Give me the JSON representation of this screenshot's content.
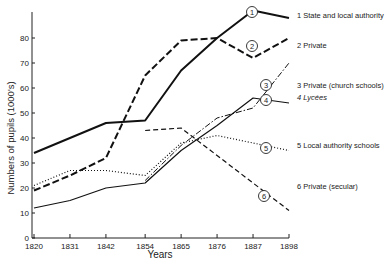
{
  "chart_data": {
    "type": "line",
    "title": "",
    "xlabel": "Years",
    "ylabel": "Numbers of pupils (1000's)",
    "x": [
      1820,
      1831,
      1842,
      1854,
      1865,
      1876,
      1887,
      1898
    ],
    "xticks": [
      "1820",
      "1831",
      "1842",
      "1854",
      "1865",
      "1876",
      "1887",
      "1898"
    ],
    "yticks": [
      "0",
      "10",
      "20",
      "30",
      "40",
      "50",
      "60",
      "70",
      "80"
    ],
    "ylim": [
      0,
      90
    ],
    "grid": false,
    "legend_position": "right",
    "series": [
      {
        "id": "1",
        "name": "1 State and local authority",
        "style": "solid-thick",
        "values": [
          34,
          40,
          46,
          47,
          67,
          80,
          91,
          88
        ]
      },
      {
        "id": "2",
        "name": "2 Private",
        "style": "dashed-thick",
        "values": [
          19,
          25,
          32,
          65,
          79,
          80,
          72,
          80
        ]
      },
      {
        "id": "3",
        "name": "3 Private (church schools)",
        "style": "dash-dot",
        "values": [
          null,
          null,
          null,
          23,
          37,
          48,
          52,
          70
        ]
      },
      {
        "id": "4",
        "name": "4 Lycées",
        "style": "solid-thin",
        "values": [
          12,
          15,
          20,
          22,
          35,
          45,
          56,
          54
        ]
      },
      {
        "id": "5",
        "name": "5 Local authority schools",
        "style": "dotted",
        "values": [
          21,
          27,
          27,
          25,
          38,
          41,
          38,
          35
        ]
      },
      {
        "id": "6",
        "name": "6 Private (secular)",
        "style": "dashed",
        "values": [
          null,
          null,
          null,
          43,
          44,
          33,
          22,
          11
        ]
      }
    ]
  }
}
